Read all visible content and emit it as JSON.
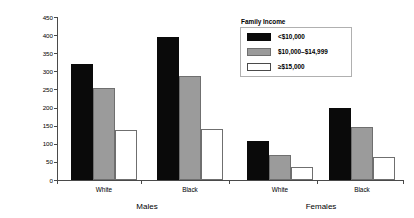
{
  "chart_data": {
    "type": "bar",
    "title": "",
    "xlabel": "",
    "ylabel": "Death Rate per 100,000 Population",
    "ylim": [
      0,
      450
    ],
    "ytick_labels": [
      "450",
      "400",
      "350",
      "300",
      "250",
      "200",
      "150",
      "100",
      "50",
      "0"
    ],
    "ytick_values": [
      450,
      400,
      350,
      300,
      250,
      200,
      150,
      100,
      50,
      0
    ],
    "grid": false,
    "legend": {
      "title": "Family Income",
      "position": "upper-right-inside",
      "entries": [
        {
          "label": "<$10,000",
          "swatch": "black",
          "color": "#0a0a0a"
        },
        {
          "label": "$10,000–$14,999",
          "swatch": "gray",
          "color": "#9b9b9b"
        },
        {
          "label": "≥$15,000",
          "swatch": "white",
          "color": "#ffffff"
        }
      ]
    },
    "supergroups": [
      {
        "label": "Males",
        "groups": [
          "White",
          "Black"
        ]
      },
      {
        "label": "Females",
        "groups": [
          "White",
          "Black"
        ]
      }
    ],
    "categories": [
      "Males White",
      "Males Black",
      "Females White",
      "Females Black"
    ],
    "series": [
      {
        "name": "<$10,000",
        "values": [
          320,
          395,
          108,
          198
        ]
      },
      {
        "name": "$10,000–$14,999",
        "values": [
          255,
          288,
          68,
          146
        ]
      },
      {
        "name": "≥$15,000",
        "values": [
          138,
          142,
          37,
          63
        ]
      }
    ]
  }
}
